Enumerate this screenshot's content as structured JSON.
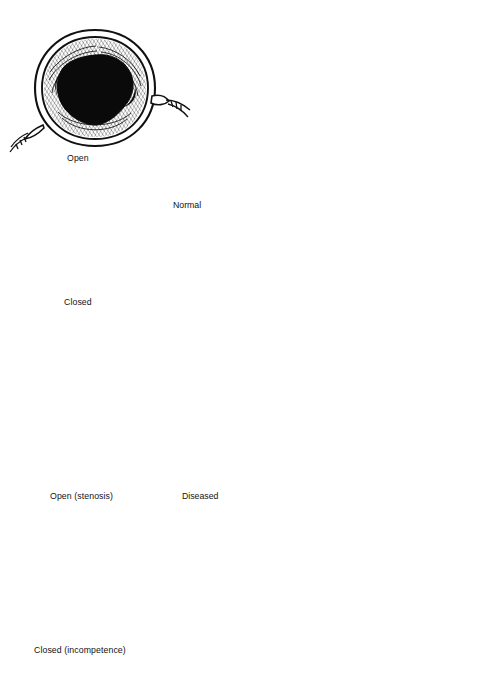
{
  "figure": {
    "background_color": "#ffffff",
    "ink_color": "#111111",
    "width": 493,
    "height": 690
  },
  "valve_panels": [
    {
      "id": "valve-open-normal",
      "caption": "Open",
      "state": "open",
      "condition": "normal",
      "lumen": "large, rounded-triangular, black",
      "cusp_count": 3
    },
    {
      "id": "valve-closed-normal",
      "caption": "Closed",
      "state": "closed",
      "condition": "normal",
      "lumen": "none (cusps coapt in Y / Mercedes pattern)",
      "cusp_count": 3
    },
    {
      "id": "valve-open-stenosis",
      "caption": "Open (stenosis)",
      "state": "open",
      "condition": "stenosis",
      "lumen": "small triangular, black",
      "cusp_count": 3
    },
    {
      "id": "valve-closed-incompetence",
      "caption": "Closed (incompetence)",
      "state": "closed",
      "condition": "incompetence",
      "lumen": "residual black gap between retracted cusps",
      "cusp_count": 3
    }
  ],
  "heart_panels": [
    {
      "id": "heart-normal",
      "callout_label": "Normal",
      "description": "Longitudinal section of left heart with aortic arch and normal aortic valve"
    },
    {
      "id": "heart-diseased",
      "callout_label": "Diseased",
      "description": "Longitudinal section of left heart with thickened, diseased aortic valve"
    }
  ],
  "signature": {
    "present": true,
    "legible": false,
    "description": "artist cursive signature"
  }
}
